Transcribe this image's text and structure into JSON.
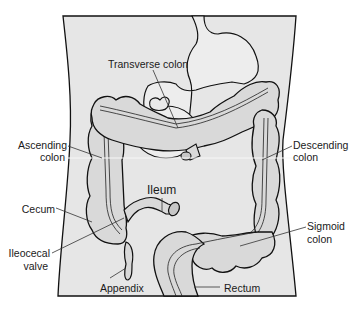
{
  "diagram": {
    "colors": {
      "background": "#ffffff",
      "torso_fill": "#e6e6e6",
      "organ_fill": "#d9d9d9",
      "stomach_fill": "#ededed",
      "outline": "#111111",
      "leader_line": "#333333"
    },
    "labels": {
      "transverse_colon": "Transverse colon",
      "ascending_colon_1": "Ascending",
      "ascending_colon_2": "colon",
      "descending_colon_1": "Descending",
      "descending_colon_2": "colon",
      "ileum": "Ileum",
      "cecum": "Cecum",
      "ileocecal_valve_1": "Ileocecal",
      "ileocecal_valve_2": "valve",
      "sigmoid_colon_1": "Sigmoid",
      "sigmoid_colon_2": "colon",
      "appendix": "Appendix",
      "rectum": "Rectum"
    }
  }
}
